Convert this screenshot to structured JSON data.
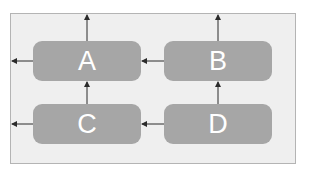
{
  "diagram": {
    "type": "flow",
    "colors": {
      "frame_fill": "#efefef",
      "frame_border": "#b4b4b4",
      "node_fill": "#a6a6a6",
      "node_text": "#ffffff",
      "arrow": "#2b2b2b"
    },
    "nodes": [
      {
        "id": "A",
        "label": "A"
      },
      {
        "id": "B",
        "label": "B"
      },
      {
        "id": "C",
        "label": "C"
      },
      {
        "id": "D",
        "label": "D"
      }
    ],
    "edges": [
      {
        "from": "A",
        "to": "up-exit"
      },
      {
        "from": "B",
        "to": "up-exit"
      },
      {
        "from": "A",
        "to": "left-exit"
      },
      {
        "from": "C",
        "to": "left-exit"
      },
      {
        "from": "B",
        "to": "A"
      },
      {
        "from": "D",
        "to": "C"
      },
      {
        "from": "C",
        "to": "A"
      },
      {
        "from": "D",
        "to": "B"
      }
    ]
  }
}
